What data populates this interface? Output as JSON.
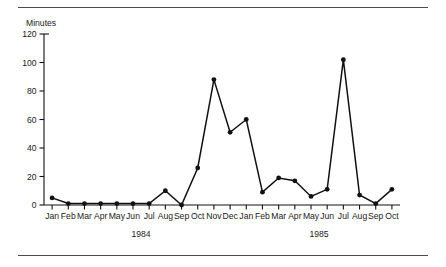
{
  "chart_data": {
    "type": "line",
    "title": "",
    "ylabel": "Minutes",
    "xlabel": "",
    "ylim": [
      0,
      120
    ],
    "yticks": [
      0,
      20,
      40,
      60,
      80,
      100,
      120
    ],
    "grid": false,
    "legend": "none",
    "marker": "filled-circle",
    "categories": [
      "Jan",
      "Feb",
      "Mar",
      "Apr",
      "May",
      "Jun",
      "Jul",
      "Aug",
      "Sep",
      "Oct",
      "Nov",
      "Dec",
      "Jan",
      "Feb",
      "Mar",
      "Apr",
      "May",
      "Jun",
      "Jul",
      "Aug",
      "Sep",
      "Oct"
    ],
    "values": [
      5,
      1,
      1,
      1,
      1,
      1,
      1,
      10,
      0,
      26,
      88,
      51,
      60,
      9,
      19,
      17,
      6,
      11,
      102,
      7,
      1,
      11
    ],
    "group_labels": [
      "1984",
      "1985"
    ],
    "groups": [
      {
        "label": "1984",
        "start_index": 0,
        "end_index": 11
      },
      {
        "label": "1985",
        "start_index": 12,
        "end_index": 21
      }
    ]
  },
  "figure": {
    "axis_color": "#111111",
    "line_color": "#111111",
    "rule_color": "#4a4a4a",
    "background": "#ffffff"
  }
}
